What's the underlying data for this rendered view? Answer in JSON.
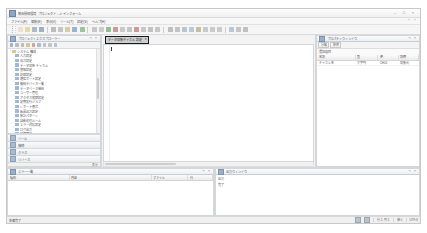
{
  "window": {
    "title": "統合開発環境 プロジェクト - メインフォーム",
    "app_icon": "application-icon",
    "controls": [
      {
        "name": "minimize-button",
        "glyph": "–"
      },
      {
        "name": "maximize-button",
        "glyph": "□"
      },
      {
        "name": "close-button",
        "glyph": "×"
      }
    ],
    "doc_controls": [
      {
        "name": "doc-restore-button",
        "glyph": "□"
      },
      {
        "name": "doc-close-button",
        "glyph": "×"
      }
    ]
  },
  "menu": {
    "items": [
      {
        "label": "ファイル(F)"
      },
      {
        "label": "編集(E)"
      },
      {
        "label": "表示(V)"
      },
      {
        "label": "ツール(T)"
      },
      {
        "label": "設定(S)"
      },
      {
        "label": "ヘルプ(H)"
      }
    ]
  },
  "toolbar": {
    "groups": [
      {
        "name": "file-group",
        "buttons": [
          {
            "name": "new-button",
            "color": "#e8e3d0"
          },
          {
            "name": "open-button",
            "color": "#e6d9a8"
          },
          {
            "name": "save-button",
            "color": "#aab9cc"
          },
          {
            "name": "save-all-button",
            "color": "#9fb0c4"
          }
        ]
      },
      {
        "name": "edit-group",
        "buttons": [
          {
            "name": "cut-button",
            "color": "#bdbdbd"
          },
          {
            "name": "copy-button",
            "color": "#c4c4c4"
          },
          {
            "name": "paste-button",
            "color": "#d6cda4"
          },
          {
            "name": "undo-button",
            "color": "#97b4d6"
          },
          {
            "name": "redo-button",
            "color": "#9cc49c"
          }
        ]
      },
      {
        "name": "build-group",
        "buttons": [
          {
            "name": "build-button",
            "color": "#c8c8c8"
          },
          {
            "name": "rebuild-button",
            "color": "#cccccc"
          },
          {
            "name": "run-button",
            "color": "#8fbf8f"
          },
          {
            "name": "stop-button",
            "color": "#c99a9a"
          },
          {
            "name": "step-button",
            "color": "#c9c9c9"
          },
          {
            "name": "debug-button",
            "color": "#c4c4c4"
          },
          {
            "name": "breakpoint-button",
            "color": "#cc9999"
          },
          {
            "name": "watch-button",
            "color": "#c7c7c7"
          },
          {
            "name": "callstack-button",
            "color": "#c2c2c2"
          },
          {
            "name": "memory-button",
            "color": "#c6c6c6"
          }
        ]
      },
      {
        "name": "view-group",
        "buttons": [
          {
            "name": "zoom-in-button",
            "color": "#bfbfbf"
          },
          {
            "name": "zoom-out-button",
            "color": "#c3c3c3"
          },
          {
            "name": "find-button",
            "color": "#b5c6d8"
          },
          {
            "name": "replace-button",
            "color": "#bcc9d6"
          },
          {
            "name": "bookmark-button",
            "color": "#c8bda0"
          },
          {
            "name": "comment-button",
            "color": "#c9c9c9"
          },
          {
            "name": "indent-button",
            "color": "#cacaca"
          },
          {
            "name": "outdent-button",
            "color": "#cacaca"
          }
        ]
      },
      {
        "name": "misc-group",
        "buttons": [
          {
            "name": "properties-button",
            "color": "#b9c6d4"
          },
          {
            "name": "options-button",
            "color": "#c5c5c5"
          },
          {
            "name": "grid-button",
            "color": "#c0c0c0"
          }
        ]
      }
    ]
  },
  "left_panel": {
    "title": "プロジェクト エクスプローラー",
    "title_icon": "project-explorer-icon",
    "title_buttons": [
      {
        "name": "panel-pin-button",
        "glyph": "⊣"
      },
      {
        "name": "panel-close-button",
        "glyph": "×"
      }
    ],
    "toolbar_buttons": [
      {
        "name": "tree-refresh-button",
        "color": "#9fb4c9"
      },
      {
        "name": "tree-collapse-button",
        "color": "#bdbdbd"
      },
      {
        "name": "tree-expand-button",
        "color": "#bdbdbd"
      },
      {
        "name": "tree-new-item-button",
        "color": "#d3c79c"
      },
      {
        "name": "tree-delete-button",
        "color": "#cfa3a3"
      },
      {
        "name": "tree-properties-button",
        "color": "#aabdd0"
      },
      {
        "name": "tree-filter-button",
        "color": "#c2c2c2"
      },
      {
        "name": "tree-sort-button",
        "color": "#c6c6c6"
      },
      {
        "name": "tree-search-button",
        "color": "#b3c4d6"
      }
    ],
    "tree": [
      {
        "depth": 0,
        "expander": "−",
        "icon_color": "#d8c98f",
        "label": "システム 構成"
      },
      {
        "depth": 1,
        "expander": "",
        "icon_color": "#9fb9d4",
        "label": "入力設定"
      },
      {
        "depth": 1,
        "expander": "",
        "icon_color": "#9fb9d4",
        "label": "出力設定"
      },
      {
        "depth": 1,
        "expander": "",
        "icon_color": "#9fb9d4",
        "label": "データ収集 チャネル"
      },
      {
        "depth": 1,
        "expander": "",
        "icon_color": "#9fb9d4",
        "label": "警報設定"
      },
      {
        "depth": 1,
        "expander": "",
        "icon_color": "#9fb9d4",
        "label": "記録設定"
      },
      {
        "depth": 1,
        "expander": "",
        "icon_color": "#9fb9d4",
        "label": "通信ポート設定"
      },
      {
        "depth": 1,
        "expander": "",
        "icon_color": "#9fb9d4",
        "label": "接続デバイス一覧"
      },
      {
        "depth": 1,
        "expander": "",
        "icon_color": "#9fb9d4",
        "label": "データベース接続"
      },
      {
        "depth": 1,
        "expander": "",
        "icon_color": "#9fb9d4",
        "label": "ユーザー管理"
      },
      {
        "depth": 1,
        "expander": "",
        "icon_color": "#9fb9d4",
        "label": "アクセス権限設定"
      },
      {
        "depth": 1,
        "expander": "",
        "icon_color": "#9fb9d4",
        "label": "定期実行ジョブ"
      },
      {
        "depth": 1,
        "expander": "",
        "icon_color": "#9fb9d4",
        "label": "レポート書式"
      },
      {
        "depth": 1,
        "expander": "",
        "icon_color": "#9fb9d4",
        "label": "帳票出力設定"
      },
      {
        "depth": 1,
        "expander": "",
        "icon_color": "#9fb9d4",
        "label": "集計パターン"
      },
      {
        "depth": 1,
        "expander": "",
        "icon_color": "#9fb9d4",
        "label": "自動処理ルール"
      },
      {
        "depth": 1,
        "expander": "",
        "icon_color": "#9fb9d4",
        "label": "エラー対応設定"
      },
      {
        "depth": 1,
        "expander": "",
        "icon_color": "#9fb9d4",
        "label": "ログ出力"
      },
      {
        "depth": 1,
        "expander": "",
        "icon_color": "#9fb9d4",
        "label": "履歴管理"
      },
      {
        "depth": 0,
        "expander": "−",
        "icon_color": "#d8c98f",
        "label": "データ"
      },
      {
        "depth": 1,
        "expander": "",
        "icon_color": "#9fb9d4",
        "label": "マスターテーブル"
      },
      {
        "depth": 1,
        "expander": "",
        "icon_color": "#9fb9d4",
        "label": "参照表"
      }
    ],
    "accordion": [
      {
        "name": "accordion-item-toolbox",
        "icon": "toolbox-icon",
        "label": "ツール"
      },
      {
        "name": "accordion-item-server",
        "icon": "server-icon",
        "label": "接続"
      },
      {
        "name": "accordion-item-class",
        "icon": "class-icon",
        "label": "クラス"
      },
      {
        "name": "accordion-item-resource",
        "icon": "resource-icon",
        "label": "リソース"
      }
    ],
    "strip": {
      "left_text": "",
      "right_text": "表示"
    }
  },
  "center": {
    "highlight": {
      "name": "document-selector-dropdown",
      "label": "データ収集 チャネル 設定",
      "caret": "▾"
    },
    "editor": {
      "name": "document-editor-surface",
      "content": ""
    }
  },
  "right_panel": {
    "title": "プロパティ ウィンドウ",
    "title_icon": "properties-icon",
    "title_buttons": [
      {
        "name": "props-pin-button",
        "glyph": "⊣"
      },
      {
        "name": "props-close-button",
        "glyph": "×"
      }
    ],
    "toolbar_buttons": [
      {
        "name": "props-category-button",
        "label": "分類"
      },
      {
        "name": "props-alpha-button",
        "label": "順序"
      }
    ],
    "subhead": "選択項目",
    "table": {
      "columns": [
        "名前",
        "型",
        "値",
        "説明"
      ],
      "column_widths": [
        38,
        22,
        20,
        20
      ],
      "rows": [
        [
          "チャネル名",
          "文字列",
          "CH01",
          "収集元"
        ]
      ]
    }
  },
  "bottom_left": {
    "title": "エラー 一覧",
    "title_icon": "error-list-icon",
    "title_buttons": [
      {
        "name": "errors-pin-button",
        "glyph": "⊣"
      },
      {
        "name": "errors-close-button",
        "glyph": "×"
      }
    ],
    "table": {
      "columns": [
        "種別",
        "内容",
        "ファイル",
        "行"
      ],
      "column_widths": [
        30,
        40,
        18,
        12
      ],
      "rows": []
    }
  },
  "bottom_right": {
    "title": "出力 ウィンドウ",
    "title_icon": "output-icon",
    "title_buttons": [
      {
        "name": "output-pin-button",
        "glyph": "⊣"
      },
      {
        "name": "output-close-button",
        "glyph": "×"
      }
    ],
    "lines": [
      "出力",
      "完了"
    ]
  },
  "status_bar": {
    "left": "準備完了",
    "segments": [
      {
        "name": "status-indicator-1",
        "type": "icon"
      },
      {
        "name": "status-indicator-2",
        "type": "icon"
      },
      {
        "name": "status-position",
        "type": "text",
        "text": "行 1, 列 1"
      },
      {
        "name": "status-mode",
        "type": "text",
        "text": "挿入"
      },
      {
        "name": "status-encoding",
        "type": "text",
        "text": "UTF-8"
      }
    ]
  }
}
